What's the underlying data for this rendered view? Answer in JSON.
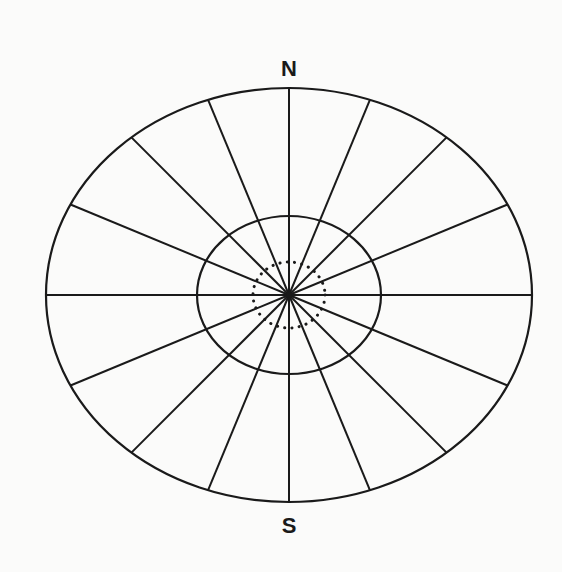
{
  "diagram": {
    "title": "",
    "type": "polar-ellipse-grid",
    "center": {
      "x": 289,
      "y": 295
    },
    "outer_ellipse": {
      "rx": 243,
      "ry": 207
    },
    "inner_ellipse": {
      "rx": 92,
      "ry": 79
    },
    "dotted_circle": {
      "rx": 36,
      "ry": 33
    },
    "spoke_count": 16,
    "stroke_color": "#1a1a1a",
    "background_color": "#fbfbfa",
    "labels": {
      "north": "N",
      "south": "S"
    }
  }
}
